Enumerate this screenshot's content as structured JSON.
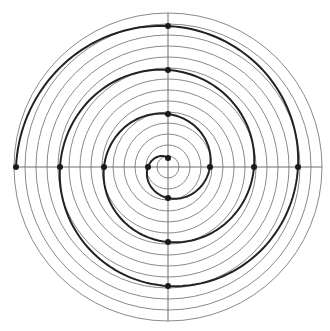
{
  "diagram": {
    "type": "archimedean-spiral-on-polar-grid",
    "canvas": {
      "width": 330,
      "height": 331
    },
    "center": {
      "x": 168,
      "y": 167
    },
    "grid": {
      "circle_count": 14,
      "circle_spacing": 11,
      "axes": [
        "horizontal",
        "vertical"
      ],
      "stroke_color": "#8a8a8a"
    },
    "spiral": {
      "start_radius": 9,
      "growth_per_quarter_turn": 11,
      "quarter_turns": 13,
      "direction": "counterclockwise",
      "start_angle": "top",
      "stroke_color": "#222222"
    },
    "marked_points": [
      {
        "position": "top",
        "x": 168,
        "y": 157
      },
      {
        "position": "left",
        "x": 146,
        "y": 166
      },
      {
        "position": "bottom",
        "x": 168,
        "y": 202
      },
      {
        "position": "right",
        "x": 213,
        "y": 166
      },
      {
        "position": "top",
        "x": 168,
        "y": 112
      },
      {
        "position": "left",
        "x": 102,
        "y": 166
      },
      {
        "position": "bottom",
        "x": 168,
        "y": 245
      },
      {
        "position": "right",
        "x": 258,
        "y": 166
      },
      {
        "position": "top",
        "x": 168,
        "y": 68
      },
      {
        "position": "left",
        "x": 58,
        "y": 166
      },
      {
        "position": "bottom",
        "x": 168,
        "y": 290
      },
      {
        "position": "right",
        "x": 302,
        "y": 166
      },
      {
        "position": "top",
        "x": 168,
        "y": 25
      },
      {
        "position": "left",
        "x": 13,
        "y": 166
      }
    ],
    "dot_color": "#1a1a1a"
  }
}
